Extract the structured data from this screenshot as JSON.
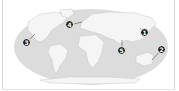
{
  "map": {
    "type": "world-map",
    "projection": "robinson-like",
    "colors": {
      "ocean": "#dcdcdc",
      "land": "#f4f4f4",
      "marker": "#222222",
      "marker_text": "#ffffff",
      "frame": "#d8d8d8"
    },
    "markers": [
      {
        "label": "1",
        "region": "East Asia",
        "x": 145,
        "y": 33
      },
      {
        "label": "2",
        "region": "Eastern Australia / Pacific",
        "x": 162,
        "y": 49
      },
      {
        "label": "3",
        "region": "West coast of North America",
        "x": 27,
        "y": 42
      },
      {
        "label": "4",
        "region": "North Atlantic",
        "x": 70,
        "y": 25
      },
      {
        "label": "5",
        "region": "Southeast Asia",
        "x": 122,
        "y": 51
      }
    ]
  }
}
